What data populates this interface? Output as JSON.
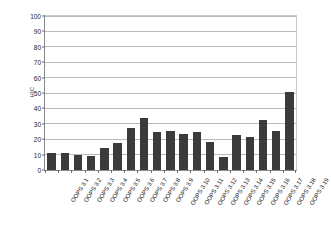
{
  "chart_data": {
    "type": "bar",
    "title": "",
    "subtitle": "",
    "xlabel": "",
    "ylabel": "HIC",
    "ylim": [
      0,
      100
    ],
    "y_ticks": [
      0,
      10,
      20,
      30,
      40,
      50,
      60,
      70,
      80,
      90,
      100
    ],
    "grid": true,
    "legend": false,
    "legend_position": "none",
    "bar_color": "#3b3b3b",
    "categories": [
      "OOPS 3.1",
      "OOPS 3.2",
      "OOPS 3.3",
      "OOPS 3.4",
      "OOPS 3.5",
      "OOPS 3.6",
      "OOPS 3.7",
      "OOPS 3.8",
      "OOPS 3.9",
      "OOPS 3.10",
      "OOPS 3.11",
      "OOPS 3.12",
      "OOPS 3.13",
      "OOPS 3.14",
      "OOPS 3.15",
      "OOPS 3.16",
      "OOPS 3.17",
      "OOPS 3.18",
      "OOPS 3.19"
    ],
    "values": [
      11,
      11,
      10,
      9,
      14,
      17.5,
      27,
      34,
      25,
      25.5,
      23.5,
      24.5,
      18.5,
      8.5,
      22.5,
      21.5,
      32.5,
      25.5,
      50.5
    ]
  },
  "axis": {
    "y_title": "HIC"
  }
}
